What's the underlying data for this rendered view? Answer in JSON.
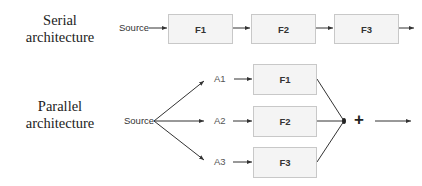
{
  "serial": {
    "title_line1": "Serial",
    "title_line2": "architecture",
    "source_label": "Source",
    "blocks": [
      "F1",
      "F2",
      "F3"
    ]
  },
  "parallel": {
    "title_line1": "Parallel",
    "title_line2": "architecture",
    "source_label": "Source",
    "inputs": [
      "A1",
      "A2",
      "A3"
    ],
    "blocks": [
      "F1",
      "F2",
      "F3"
    ],
    "combiner_symbol": "+"
  },
  "colors": {
    "box_fill": "#f4f4f4",
    "box_border": "#c8c8c8",
    "line": "#333333"
  }
}
